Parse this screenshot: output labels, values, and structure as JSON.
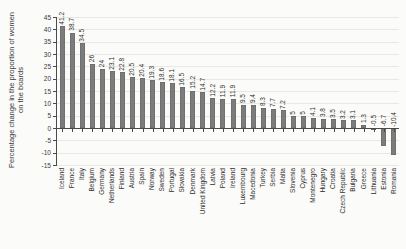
{
  "figure": {
    "background": "#fbfbf9",
    "bar_color": "#7c7c7c",
    "bar_edge_color": "#646464",
    "axis_color": "#4a4a4a",
    "grid_color": "#e9e9e4",
    "text_color": "#3a3a3a"
  },
  "chart_data": {
    "type": "bar",
    "title": "",
    "xlabel": "",
    "ylabel": "Percentage change in the proportion of women on the boards",
    "ylabel_lines": [
      "Percentage change in the proportion of women",
      "on the boards"
    ],
    "ylim": [
      -15,
      45
    ],
    "ytick_step": 5,
    "grid": true,
    "legend": "none",
    "categories": [
      "Iceland",
      "France",
      "Italy",
      "Belgium",
      "Germany",
      "Netherlands",
      "Finland",
      "Austria",
      "Spain",
      "Norway",
      "Sweden",
      "Portugal",
      "Slovakia",
      "Denmark",
      "United Kingdom",
      "Latvia",
      "Poland",
      "Ireland",
      "Luxembourg",
      "Macedonia",
      "Turkey",
      "Serbia",
      "Malta",
      "Slovenia",
      "Cyprus",
      "Montenegro",
      "Hungary",
      "Croatia",
      "Czech Republic",
      "Bulgaria",
      "Greece",
      "Lithuania",
      "Estonia",
      "Romania"
    ],
    "values": [
      41.2,
      38.7,
      34.5,
      26,
      24,
      23.1,
      22.8,
      20.5,
      20.4,
      19.3,
      18.6,
      18.1,
      16.5,
      15.2,
      14.7,
      12.2,
      11.9,
      11.9,
      9.5,
      9.4,
      8.3,
      7.7,
      7.2,
      5,
      5,
      4.1,
      3.8,
      3.5,
      3.2,
      3.1,
      1.3,
      -0.5,
      -6.7,
      -10.4
    ]
  }
}
